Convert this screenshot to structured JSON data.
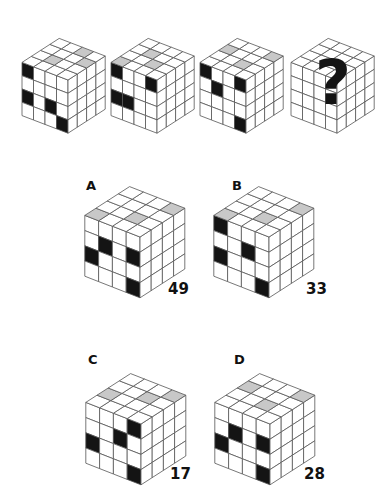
{
  "puzzle": {
    "question_mark": "?",
    "colors": {
      "white": "#ffffff",
      "gray": "#c8c8c8",
      "dark": "#141414",
      "line": "#555555"
    },
    "sequence": [
      {
        "id": "seq-1",
        "front": [
          68,
          80
        ],
        "scale": "small",
        "top": [
          [
            0,
            0,
            0,
            0
          ],
          [
            0,
            1,
            0,
            0
          ],
          [
            0,
            0,
            0,
            1
          ],
          [
            0,
            0,
            1,
            0
          ]
        ],
        "left": [
          [
            2,
            0,
            0,
            0
          ],
          [
            0,
            0,
            0,
            0
          ],
          [
            2,
            0,
            2,
            0
          ],
          [
            0,
            0,
            0,
            2
          ]
        ],
        "right": [
          [
            0,
            0,
            0,
            0
          ],
          [
            0,
            0,
            0,
            0
          ],
          [
            0,
            0,
            0,
            0
          ],
          [
            0,
            0,
            0,
            0
          ]
        ]
      },
      {
        "id": "seq-2",
        "front": [
          157,
          80
        ],
        "scale": "small",
        "top": [
          [
            1,
            0,
            0,
            0
          ],
          [
            0,
            0,
            1,
            0
          ],
          [
            0,
            1,
            0,
            0
          ],
          [
            0,
            0,
            0,
            0
          ]
        ],
        "left": [
          [
            2,
            0,
            0,
            2
          ],
          [
            0,
            0,
            0,
            0
          ],
          [
            2,
            2,
            0,
            0
          ],
          [
            0,
            0,
            0,
            0
          ]
        ],
        "right": [
          [
            0,
            0,
            0,
            0
          ],
          [
            0,
            0,
            0,
            0
          ],
          [
            0,
            0,
            0,
            0
          ],
          [
            0,
            0,
            0,
            0
          ]
        ]
      },
      {
        "id": "seq-3",
        "front": [
          246,
          80
        ],
        "scale": "small",
        "top": [
          [
            0,
            0,
            1,
            0
          ],
          [
            0,
            0,
            0,
            0
          ],
          [
            0,
            1,
            0,
            0
          ],
          [
            0,
            0,
            0,
            1
          ]
        ],
        "left": [
          [
            2,
            0,
            0,
            2
          ],
          [
            0,
            2,
            0,
            0
          ],
          [
            0,
            0,
            0,
            0
          ],
          [
            0,
            0,
            0,
            2
          ]
        ],
        "right": [
          [
            0,
            0,
            0,
            0
          ],
          [
            0,
            0,
            0,
            0
          ],
          [
            0,
            0,
            0,
            0
          ],
          [
            0,
            0,
            0,
            0
          ]
        ]
      },
      {
        "id": "seq-4",
        "front": [
          337,
          80
        ],
        "scale": "small",
        "unknown": true,
        "top": [
          [
            0,
            0,
            0,
            0
          ],
          [
            0,
            0,
            0,
            0
          ],
          [
            0,
            0,
            0,
            0
          ],
          [
            0,
            0,
            0,
            0
          ]
        ],
        "left": [
          [
            0,
            0,
            0,
            0
          ],
          [
            0,
            0,
            0,
            0
          ],
          [
            0,
            0,
            0,
            0
          ],
          [
            0,
            0,
            0,
            0
          ]
        ],
        "right": [
          [
            0,
            0,
            0,
            0
          ],
          [
            0,
            0,
            0,
            0
          ],
          [
            0,
            0,
            0,
            0
          ],
          [
            0,
            0,
            0,
            0
          ]
        ]
      }
    ],
    "options": [
      {
        "letter": "A",
        "code": "49",
        "front": [
          140,
          237
        ],
        "scale": "large",
        "letter_pos": [
          86,
          178
        ],
        "code_pos": [
          168,
          280
        ],
        "top": [
          [
            1,
            0,
            0,
            0
          ],
          [
            0,
            0,
            0,
            0
          ],
          [
            0,
            1,
            0,
            0
          ],
          [
            0,
            0,
            0,
            1
          ]
        ],
        "left": [
          [
            0,
            0,
            0,
            0
          ],
          [
            0,
            2,
            0,
            2
          ],
          [
            2,
            0,
            0,
            0
          ],
          [
            0,
            0,
            0,
            2
          ]
        ],
        "right": [
          [
            0,
            0,
            0,
            0
          ],
          [
            0,
            0,
            0,
            0
          ],
          [
            0,
            0,
            0,
            0
          ],
          [
            0,
            0,
            0,
            0
          ]
        ]
      },
      {
        "letter": "B",
        "code": "33",
        "front": [
          269,
          237
        ],
        "scale": "large",
        "letter_pos": [
          232,
          178
        ],
        "code_pos": [
          306,
          280
        ],
        "top": [
          [
            1,
            0,
            0,
            0
          ],
          [
            0,
            0,
            0,
            0
          ],
          [
            0,
            1,
            0,
            0
          ],
          [
            0,
            0,
            0,
            1
          ]
        ],
        "left": [
          [
            2,
            0,
            0,
            0
          ],
          [
            0,
            0,
            2,
            0
          ],
          [
            2,
            0,
            0,
            0
          ],
          [
            0,
            0,
            0,
            2
          ]
        ],
        "right": [
          [
            0,
            0,
            0,
            0
          ],
          [
            0,
            0,
            0,
            0
          ],
          [
            0,
            0,
            0,
            0
          ],
          [
            0,
            0,
            0,
            0
          ]
        ]
      },
      {
        "letter": "C",
        "code": "17",
        "front": [
          141,
          424
        ],
        "scale": "large",
        "letter_pos": [
          88,
          352
        ],
        "code_pos": [
          170,
          465
        ],
        "top": [
          [
            0,
            1,
            0,
            0
          ],
          [
            0,
            0,
            0,
            0
          ],
          [
            0,
            0,
            1,
            0
          ],
          [
            0,
            0,
            0,
            1
          ]
        ],
        "left": [
          [
            0,
            0,
            0,
            2
          ],
          [
            0,
            0,
            2,
            0
          ],
          [
            2,
            0,
            0,
            0
          ],
          [
            0,
            0,
            0,
            2
          ]
        ],
        "right": [
          [
            0,
            0,
            0,
            0
          ],
          [
            0,
            0,
            0,
            0
          ],
          [
            0,
            0,
            0,
            0
          ],
          [
            0,
            0,
            0,
            0
          ]
        ]
      },
      {
        "letter": "D",
        "code": "28",
        "front": [
          270,
          424
        ],
        "scale": "large",
        "letter_pos": [
          234,
          352
        ],
        "code_pos": [
          304,
          465
        ],
        "top": [
          [
            0,
            0,
            1,
            0
          ],
          [
            0,
            0,
            0,
            0
          ],
          [
            0,
            1,
            0,
            0
          ],
          [
            0,
            0,
            0,
            1
          ]
        ],
        "left": [
          [
            0,
            0,
            0,
            0
          ],
          [
            0,
            2,
            0,
            2
          ],
          [
            2,
            0,
            0,
            0
          ],
          [
            0,
            0,
            0,
            2
          ]
        ],
        "right": [
          [
            0,
            0,
            0,
            0
          ],
          [
            0,
            0,
            0,
            0
          ],
          [
            0,
            0,
            0,
            0
          ],
          [
            0,
            0,
            0,
            0
          ]
        ]
      }
    ]
  }
}
